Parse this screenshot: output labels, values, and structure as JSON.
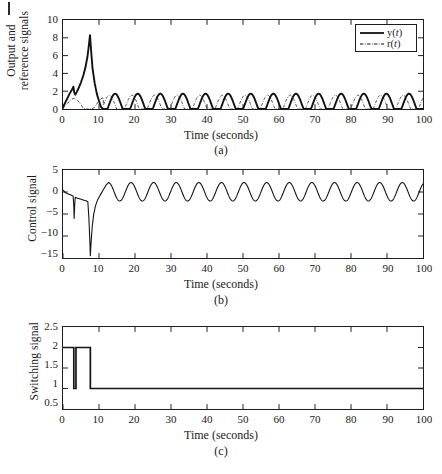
{
  "figure": {
    "kind": "multi-panel-simulation-figure",
    "panel_count": 3,
    "background_color": "#ffffff",
    "ink_color": "#1d1d1d"
  },
  "panels": [
    {
      "id": "a",
      "caption": "(a)",
      "xlabel": "Time (seconds)",
      "ylabel": "Output and\nreference signals",
      "ylabel_line1": "Output and",
      "ylabel_line2": "reference signals",
      "xticks": [
        "0",
        "10",
        "20",
        "30",
        "40",
        "50",
        "60",
        "70",
        "80",
        "90",
        "100"
      ],
      "yticks": [
        "0",
        "2",
        "4",
        "6",
        "8",
        "10"
      ],
      "legend": {
        "position": "top-right",
        "entries": [
          {
            "label_plain": "y(t)",
            "label_pre": "y(",
            "label_var": "t",
            "label_post": ")",
            "style": "solid",
            "name": "output-signal"
          },
          {
            "label_plain": "r(t)",
            "label_pre": "r(",
            "label_var": "t",
            "label_post": ")",
            "style": "dash-dot",
            "name": "reference-signal"
          }
        ]
      }
    },
    {
      "id": "b",
      "caption": "(b)",
      "xlabel": "Time (seconds)",
      "ylabel": "Control signal",
      "xticks": [
        "0",
        "10",
        "20",
        "30",
        "40",
        "50",
        "60",
        "70",
        "80",
        "90",
        "100"
      ],
      "yticks": [
        "5",
        "0",
        "−5",
        "−10",
        "−15"
      ]
    },
    {
      "id": "c",
      "caption": "(c)",
      "xlabel": "Time (seconds)",
      "ylabel": "Switching signal",
      "xticks": [
        "0",
        "10",
        "20",
        "30",
        "40",
        "50",
        "60",
        "70",
        "80",
        "90",
        "100"
      ],
      "yticks": [
        "2.5",
        "2",
        "1.5",
        "1",
        "0.5"
      ]
    }
  ],
  "chart_data": [
    {
      "type": "line",
      "panel": "a",
      "title": "",
      "xlabel": "Time (seconds)",
      "ylabel": "Output and reference signals",
      "xlim": [
        0,
        100
      ],
      "ylim": [
        0,
        10
      ],
      "xticks": [
        0,
        10,
        20,
        30,
        40,
        50,
        60,
        70,
        80,
        90,
        100
      ],
      "yticks": [
        0,
        2,
        4,
        6,
        8,
        10
      ],
      "grid": false,
      "legend_position": "top-right",
      "series": [
        {
          "name": "y(t)",
          "style": "solid",
          "linewidth": 2.0,
          "description": "Output signal: transient with local peak ~2.5 at t=3, sharp overshoot peak ~8.3 at t=7.5, then settles into sinusoid of amplitude ~1.1 about mean ~0.6 with period ~6.28 s",
          "transient_points": [
            [
              0.0,
              0.2
            ],
            [
              0.6,
              0.7
            ],
            [
              1.2,
              1.2
            ],
            [
              1.8,
              1.7
            ],
            [
              2.4,
              2.1
            ],
            [
              2.9,
              2.5
            ],
            [
              3.1,
              1.9
            ],
            [
              3.4,
              1.6
            ],
            [
              3.8,
              1.9
            ],
            [
              4.4,
              2.4
            ],
            [
              5.0,
              3.0
            ],
            [
              5.6,
              3.7
            ],
            [
              6.2,
              4.6
            ],
            [
              6.8,
              5.9
            ],
            [
              7.2,
              7.2
            ],
            [
              7.5,
              8.3
            ],
            [
              7.8,
              6.6
            ],
            [
              8.2,
              4.6
            ],
            [
              8.8,
              2.9
            ],
            [
              9.4,
              1.7
            ],
            [
              10.0,
              0.9
            ],
            [
              10.6,
              0.2
            ],
            [
              11.2,
              -0.3
            ],
            [
              11.8,
              -0.5
            ]
          ],
          "steady_state": {
            "form": "mean + amplitude*sin(2*pi*(t - phase)/period)",
            "mean": 0.6,
            "amplitude": 1.12,
            "period": 6.28,
            "phase": 12.9,
            "t_start": 11.8,
            "t_end": 100
          }
        },
        {
          "name": "r(t)",
          "style": "dash-dot",
          "linewidth": 0.9,
          "description": "Reference signal: sinusoid amplitude ~1.05 about mean ~0.5, period ~6.28 s, slightly lagging y(t) in steady state",
          "transient_points": [
            [
              0.0,
              0.1
            ],
            [
              0.8,
              0.4
            ],
            [
              1.6,
              0.8
            ],
            [
              2.4,
              1.1
            ],
            [
              3.2,
              1.2
            ],
            [
              4.0,
              1.0
            ],
            [
              4.8,
              0.6
            ],
            [
              5.6,
              0.1
            ],
            [
              6.4,
              -0.3
            ],
            [
              7.2,
              -0.5
            ],
            [
              8.0,
              -0.3
            ],
            [
              8.8,
              0.2
            ],
            [
              9.6,
              0.7
            ],
            [
              10.4,
              1.1
            ],
            [
              11.2,
              1.3
            ]
          ],
          "steady_state": {
            "form": "mean + amplitude*sin(2*pi*(t - phase)/period)",
            "mean": 0.5,
            "amplitude": 1.05,
            "period": 6.28,
            "phase": 11.3,
            "t_start": 11.2,
            "t_end": 100
          }
        }
      ]
    },
    {
      "type": "line",
      "panel": "b",
      "title": "",
      "xlabel": "Time (seconds)",
      "ylabel": "Control signal",
      "xlim": [
        0,
        100
      ],
      "ylim": [
        -15,
        5
      ],
      "xticks": [
        0,
        10,
        20,
        30,
        40,
        50,
        60,
        70,
        80,
        90,
        100
      ],
      "yticks": [
        5,
        0,
        -5,
        -10,
        -15
      ],
      "grid": false,
      "series": [
        {
          "name": "u(t)",
          "style": "solid",
          "linewidth": 1.1,
          "description": "Control signal: near 0 initially, narrow negative spike to about -6 at t=3, deep dip to about -14.5 at t=7.5, recovery by t=12, then steady sinusoid of amplitude ~2.1 about mean ~0 with period ~6.28 s",
          "transient_points": [
            [
              0.0,
              0.4
            ],
            [
              0.5,
              0.0
            ],
            [
              1.0,
              -0.3
            ],
            [
              1.6,
              -0.5
            ],
            [
              2.2,
              -0.7
            ],
            [
              2.8,
              -0.9
            ],
            [
              3.0,
              -3.2
            ],
            [
              3.1,
              -6.0
            ],
            [
              3.25,
              -3.0
            ],
            [
              3.4,
              -1.2
            ],
            [
              4.0,
              -1.4
            ],
            [
              4.8,
              -1.6
            ],
            [
              5.6,
              -1.8
            ],
            [
              6.4,
              -2.0
            ],
            [
              6.9,
              -2.2
            ],
            [
              7.2,
              -6.0
            ],
            [
              7.45,
              -11.0
            ],
            [
              7.6,
              -14.5
            ],
            [
              7.8,
              -11.5
            ],
            [
              8.1,
              -8.0
            ],
            [
              8.5,
              -5.2
            ],
            [
              9.0,
              -3.2
            ],
            [
              9.6,
              -1.8
            ],
            [
              10.4,
              -0.6
            ],
            [
              11.2,
              0.5
            ],
            [
              12.0,
              1.6
            ],
            [
              12.6,
              2.1
            ]
          ],
          "steady_state": {
            "form": "mean + amplitude*sin(2*pi*(t - phase)/period)",
            "mean": 0.05,
            "amplitude": 2.1,
            "period": 6.28,
            "phase": 11.05,
            "t_start": 12.6,
            "t_end": 100
          }
        }
      ]
    },
    {
      "type": "step",
      "panel": "c",
      "title": "",
      "xlabel": "Time (seconds)",
      "ylabel": "Switching signal",
      "xlim": [
        0,
        100
      ],
      "ylim": [
        0.5,
        2.5
      ],
      "xticks": [
        0,
        10,
        20,
        30,
        40,
        50,
        60,
        70,
        80,
        90,
        100
      ],
      "yticks": [
        2.5,
        2,
        1.5,
        1,
        0.5
      ],
      "grid": false,
      "series": [
        {
          "name": "sigma(t)",
          "style": "solid",
          "linewidth": 1.6,
          "description": "Piecewise-constant switching signal: value 2 from t=0 to t=3, value 1 from t=3 to t=3.6, value 2 from t=3.6 to t=7.6, then value 1 for the remainder",
          "steps": [
            {
              "t_start": 0.0,
              "t_end": 3.0,
              "value": 2
            },
            {
              "t_start": 3.0,
              "t_end": 3.6,
              "value": 1
            },
            {
              "t_start": 3.6,
              "t_end": 7.6,
              "value": 2
            },
            {
              "t_start": 7.6,
              "t_end": 100.0,
              "value": 1
            }
          ]
        }
      ]
    }
  ]
}
